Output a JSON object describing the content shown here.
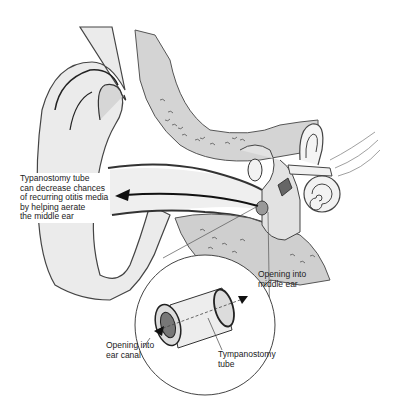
{
  "diagram": {
    "labels": {
      "main_caption": "Typanostomy tube\ncan decrease chances\nof recurring otitis media\nby helping aerate\nthe middle ear",
      "opening_middle_ear": "Opening into\nmiddle ear",
      "opening_ear_canal": "Opening into\near canal",
      "tympanostomy_tube": "Tympanostomy\ntube"
    },
    "structures": [
      "outer-ear",
      "ear-canal",
      "temporal-bone",
      "ossicles",
      "cochlea",
      "semicircular-canals",
      "eardrum",
      "tympanostomy-tube",
      "magnified-inset"
    ],
    "colors": {
      "skin": "#ebebeb",
      "bone": "#cfcfcf",
      "outline": "#333333",
      "background": "#ffffff"
    }
  }
}
